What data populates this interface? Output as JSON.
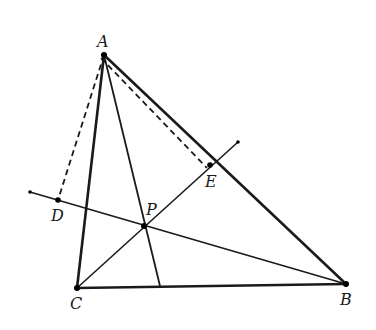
{
  "diagram": {
    "title": "",
    "points": {
      "A": {
        "label": "A",
        "x": 104,
        "y": 55
      },
      "B": {
        "label": "B",
        "x": 346,
        "y": 284
      },
      "C": {
        "label": "C",
        "x": 77,
        "y": 288
      },
      "P": {
        "label": "P",
        "x": 144,
        "y": 226
      },
      "D": {
        "label": "D",
        "x": 58,
        "y": 200
      },
      "E": {
        "label": "E",
        "x": 210,
        "y": 165
      }
    },
    "segments": [
      {
        "from": "A",
        "to": "B",
        "style": "solid-thick"
      },
      {
        "from": "A",
        "to": "C",
        "style": "solid-thick"
      },
      {
        "from": "C",
        "to": "B",
        "style": "solid-thick"
      },
      {
        "from": "A",
        "to": "foot",
        "style": "solid"
      },
      {
        "from": "line-start",
        "to": "B",
        "style": "solid"
      },
      {
        "from": "C",
        "to": "line-end",
        "style": "solid"
      },
      {
        "from": "A",
        "to": "D",
        "style": "dashed"
      },
      {
        "from": "A",
        "to": "E",
        "style": "dashed"
      }
    ],
    "stroke_color": "#1a1a1a"
  }
}
